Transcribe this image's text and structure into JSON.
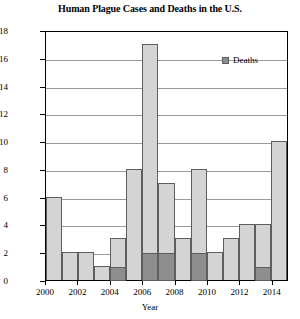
{
  "chart_data": {
    "type": "bar",
    "title": "Human Plague Cases and Deaths in the U.S.",
    "xlabel": "Year",
    "ylabel": "Cases",
    "ylim": [
      0,
      18
    ],
    "ytick_step": 2,
    "yticks": [
      0,
      2,
      4,
      6,
      8,
      10,
      12,
      14,
      16,
      18
    ],
    "xticks": [
      "2000",
      "2002",
      "2004",
      "2006",
      "2008",
      "2010",
      "2012",
      "2014"
    ],
    "grid": true,
    "legend": {
      "position": "top-right",
      "entries": [
        {
          "name": "Deaths",
          "color": "#8e8e8e"
        }
      ]
    },
    "categories": [
      "2000",
      "2001",
      "2002",
      "2003",
      "2004",
      "2005",
      "2006",
      "2007",
      "2008",
      "2009",
      "2010",
      "2011",
      "2012",
      "2013",
      "2014"
    ],
    "series": [
      {
        "name": "Cases",
        "color": "#d4d4d4",
        "values": [
          6,
          2,
          2,
          1,
          3,
          8,
          17,
          7,
          3,
          8,
          2,
          3,
          4,
          4,
          10
        ]
      },
      {
        "name": "Deaths",
        "color": "#8e8e8e",
        "values": [
          0,
          0,
          0,
          0,
          1,
          0,
          2,
          2,
          0,
          2,
          0,
          0,
          0,
          1,
          0
        ]
      }
    ]
  }
}
